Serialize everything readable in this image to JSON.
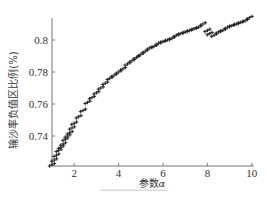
{
  "chart_data": {
    "type": "scatter",
    "title": "",
    "xlabel": "参数α",
    "ylabel": "输沙率负值区比例(%)",
    "xlim": [
      1,
      10
    ],
    "ylim": [
      0.72,
      0.815
    ],
    "xticks": [
      2,
      4,
      6,
      8,
      10
    ],
    "yticks": [
      0.74,
      0.76,
      0.78,
      0.8
    ],
    "xtick_labels": [
      "2",
      "4",
      "6",
      "8",
      "10"
    ],
    "ytick_labels": [
      "0.74",
      "0.76",
      "0.78",
      "0.8"
    ],
    "grid": false,
    "legend": null,
    "marker": "+",
    "series": [
      {
        "name": "ratio",
        "x": [
          1.0,
          1.1,
          1.2,
          1.3,
          1.4,
          1.5,
          1.6,
          1.7,
          1.8,
          1.9,
          2.0,
          2.2,
          2.4,
          2.6,
          2.8,
          3.0,
          3.2,
          3.4,
          3.6,
          3.8,
          4.0,
          4.2,
          4.4,
          4.6,
          4.8,
          5.0,
          5.2,
          5.4,
          5.6,
          5.8,
          6.0,
          6.2,
          6.4,
          6.6,
          6.8,
          7.0,
          7.2,
          7.4,
          7.6,
          7.8,
          8.0,
          8.1,
          8.3,
          8.5,
          8.7,
          8.9,
          9.1,
          9.3,
          9.5,
          9.7,
          9.9
        ],
        "y": [
          0.722,
          0.725,
          0.728,
          0.731,
          0.733,
          0.735,
          0.738,
          0.74,
          0.742,
          0.745,
          0.748,
          0.752,
          0.756,
          0.761,
          0.764,
          0.767,
          0.77,
          0.773,
          0.776,
          0.778,
          0.78,
          0.782,
          0.785,
          0.787,
          0.789,
          0.791,
          0.793,
          0.795,
          0.796,
          0.798,
          0.799,
          0.8,
          0.801,
          0.803,
          0.804,
          0.805,
          0.806,
          0.807,
          0.808,
          0.81,
          0.806,
          0.804,
          0.803,
          0.805,
          0.806,
          0.808,
          0.809,
          0.81,
          0.811,
          0.812,
          0.814
        ]
      }
    ]
  },
  "labels": {
    "xlabel_prefix": "参数",
    "xlabel_var": "α",
    "ylabel": "输沙率负值区比例(%)"
  }
}
